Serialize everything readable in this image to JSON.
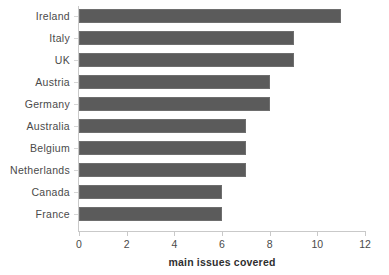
{
  "chart_data": {
    "type": "bar",
    "orientation": "horizontal",
    "title": "",
    "subtitle": "",
    "xlabel": "main issues covered",
    "ylabel": "",
    "categories": [
      "Ireland",
      "Italy",
      "UK",
      "Austria",
      "Germany",
      "Australia",
      "Belgium",
      "Netherlands",
      "Canada",
      "France"
    ],
    "values": [
      11,
      9,
      9,
      8,
      8,
      7,
      7,
      7,
      6,
      6
    ],
    "xlim": [
      0,
      12
    ],
    "xticks": [
      0,
      2,
      4,
      6,
      8,
      10,
      12
    ],
    "xtick_labels": [
      "0",
      "2",
      "4",
      "6",
      "8",
      "10",
      "12"
    ],
    "grid": false,
    "legend": false,
    "legend_position": "none",
    "bar_color": "#5b5b5b",
    "axis_color": "#c9c9c9",
    "text_color": "#4a4a4a",
    "background": "#ffffff"
  }
}
